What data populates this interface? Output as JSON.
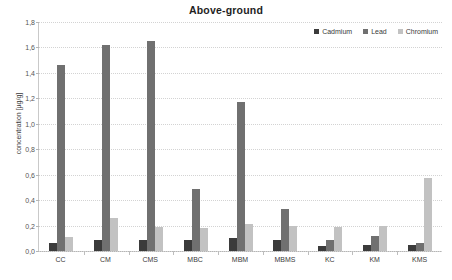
{
  "chart_data": {
    "type": "bar",
    "title": "Above-ground",
    "xlabel": "",
    "ylabel": "concentration [µg/g]",
    "ylim": [
      0,
      1.8
    ],
    "ytick_labels": [
      "0,0",
      "0,2",
      "0,4",
      "0,6",
      "0,8",
      "1,0",
      "1,2",
      "1,4",
      "1,6",
      "1,8"
    ],
    "ytick_values": [
      0,
      0.2,
      0.4,
      0.6,
      0.8,
      1.0,
      1.2,
      1.4,
      1.6,
      1.8
    ],
    "grid": true,
    "legend_position": "top-right",
    "categories": [
      "CC",
      "CM",
      "CMS",
      "MBC",
      "MBM",
      "MBMS",
      "KC",
      "KM",
      "KMS"
    ],
    "series": [
      {
        "name": "Cadmium",
        "color": "#3b3b3b",
        "values": [
          0.06,
          0.09,
          0.09,
          0.09,
          0.1,
          0.09,
          0.04,
          0.05,
          0.05
        ]
      },
      {
        "name": "Lead",
        "color": "#707070",
        "values": [
          1.46,
          1.62,
          1.65,
          0.49,
          1.17,
          0.33,
          0.09,
          0.12,
          0.06
        ]
      },
      {
        "name": "Chromium",
        "color": "#c2c2c2",
        "values": [
          0.11,
          0.26,
          0.19,
          0.18,
          0.21,
          0.2,
          0.19,
          0.2,
          0.57
        ]
      }
    ]
  },
  "legend": {
    "items": [
      {
        "label": "Cadmium",
        "color": "#3b3b3b"
      },
      {
        "label": "Lead",
        "color": "#707070"
      },
      {
        "label": "Chromium",
        "color": "#c2c2c2"
      }
    ]
  }
}
